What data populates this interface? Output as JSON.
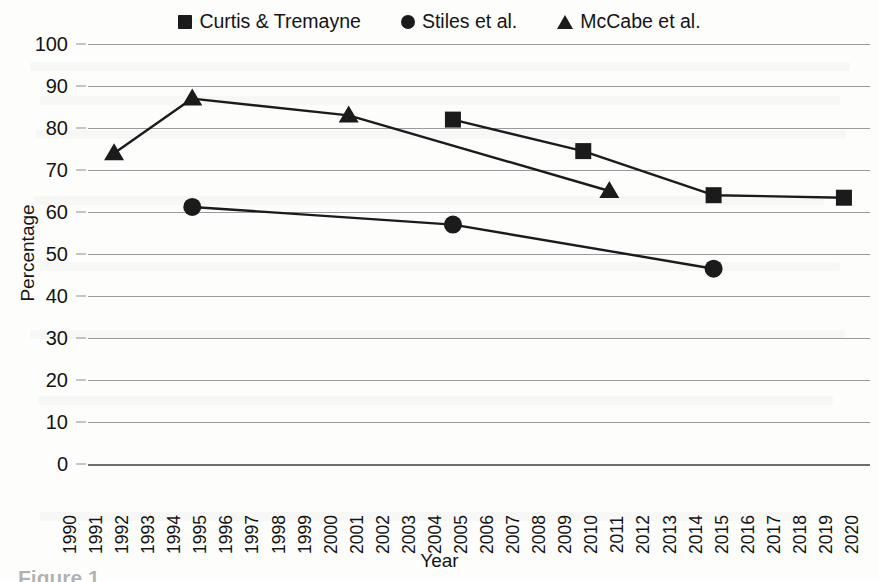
{
  "figure": {
    "caption": "Figure 1"
  },
  "legend": {
    "position": "top-center",
    "entries": [
      {
        "label": "Curtis & Tremayne",
        "marker": "square-marker-icon"
      },
      {
        "label": "Stiles et al.",
        "marker": "circle-marker-icon"
      },
      {
        "label": "McCabe et al.",
        "marker": "triangle-marker-icon"
      }
    ]
  },
  "axes": {
    "x_title": "Year",
    "y_title": "Percentage",
    "y_ticks": [
      "0",
      "10",
      "20",
      "30",
      "40",
      "50",
      "60",
      "70",
      "80",
      "90",
      "100"
    ],
    "x_ticks": [
      "1990",
      "1991",
      "1992",
      "1993",
      "1994",
      "1995",
      "1996",
      "1997",
      "1998",
      "1999",
      "2000",
      "2001",
      "2002",
      "2003",
      "2004",
      "2005",
      "2006",
      "2007",
      "2008",
      "2009",
      "2010",
      "2011",
      "2012",
      "2013",
      "2014",
      "2015",
      "2016",
      "2017",
      "2018",
      "2019",
      "2020"
    ]
  },
  "colors": {
    "ink": "#1b1b1b",
    "gridline": "#9a9a9e",
    "page": "#fdfdfc"
  },
  "chart_data": {
    "type": "line",
    "title": "",
    "xlabel": "Year",
    "ylabel": "Percentage",
    "xlim": [
      1990,
      2020
    ],
    "ylim": [
      0,
      100
    ],
    "ytick_step": 10,
    "xtick_step": 1,
    "grid": true,
    "legend_position": "top-center",
    "series": [
      {
        "name": "Curtis & Tremayne",
        "marker": "square",
        "x": [
          2004,
          2009,
          2014,
          2019
        ],
        "y": [
          82.0,
          74.5,
          64.0,
          63.4
        ]
      },
      {
        "name": "Stiles et al.",
        "marker": "circle",
        "x": [
          1994,
          2004,
          2014
        ],
        "y": [
          61.2,
          57.0,
          46.5
        ]
      },
      {
        "name": "McCabe et al.",
        "marker": "triangle",
        "x": [
          1991,
          1994,
          2000,
          2010
        ],
        "y": [
          74.0,
          87.0,
          83.0,
          65.0
        ]
      }
    ]
  }
}
